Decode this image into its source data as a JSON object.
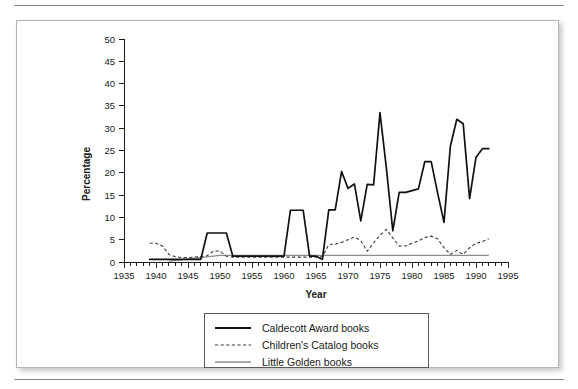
{
  "figure": {
    "has_top_rule": true,
    "has_bottom_rule": true,
    "border_color": "#b5b5b5",
    "background": "#ffffff"
  },
  "chart_data": {
    "type": "line",
    "title": "",
    "xlabel": "Year",
    "ylabel": "Percentage",
    "xlim": [
      1935,
      1995
    ],
    "ylim": [
      0,
      50
    ],
    "xticks": [
      1935,
      1940,
      1945,
      1950,
      1955,
      1960,
      1965,
      1970,
      1975,
      1980,
      1985,
      1990,
      1995
    ],
    "yticks": [
      0,
      5,
      10,
      15,
      20,
      25,
      30,
      35,
      40,
      45,
      50
    ],
    "x_minor_tick_step": 1,
    "grid": false,
    "legend_position": "below-center",
    "series": [
      {
        "name": "Caldecott Award books",
        "style": "solid",
        "color": "#111111",
        "width": 1.7,
        "x": [
          1939,
          1940,
          1941,
          1942,
          1943,
          1944,
          1945,
          1946,
          1947,
          1948,
          1949,
          1950,
          1951,
          1952,
          1953,
          1954,
          1955,
          1956,
          1957,
          1958,
          1959,
          1960,
          1961,
          1962,
          1963,
          1964,
          1965,
          1966,
          1967,
          1968,
          1969,
          1970,
          1971,
          1972,
          1973,
          1974,
          1975,
          1976,
          1977,
          1978,
          1979,
          1980,
          1981,
          1982,
          1983,
          1984,
          1985,
          1986,
          1987,
          1988,
          1989,
          1990,
          1991,
          1992
        ],
        "values": [
          0.6,
          0.6,
          0.6,
          0.6,
          0.6,
          0.6,
          0.6,
          0.6,
          0.6,
          6.5,
          6.5,
          6.5,
          6.5,
          1.3,
          1.3,
          1.3,
          1.3,
          1.3,
          1.3,
          1.3,
          1.3,
          1.3,
          11.6,
          11.6,
          11.6,
          1.3,
          1.3,
          0.6,
          11.7,
          11.7,
          20.3,
          16.5,
          17.5,
          9.2,
          17.4,
          17.3,
          33.5,
          21.0,
          7.0,
          15.6,
          15.6,
          16.0,
          16.4,
          22.5,
          22.5,
          15.5,
          8.9,
          26.0,
          32.0,
          31.0,
          14.2,
          23.5,
          25.4,
          25.4
        ]
      },
      {
        "name": "Children's Catalog books",
        "style": "dashed",
        "color": "#3a3a3a",
        "width": 1.1,
        "x": [
          1939,
          1940,
          1941,
          1942,
          1943,
          1944,
          1945,
          1946,
          1947,
          1948,
          1949,
          1950,
          1951,
          1952,
          1953,
          1954,
          1955,
          1956,
          1957,
          1958,
          1959,
          1960,
          1961,
          1962,
          1963,
          1964,
          1965,
          1966,
          1967,
          1968,
          1969,
          1970,
          1971,
          1972,
          1973,
          1974,
          1975,
          1976,
          1977,
          1978,
          1979,
          1980,
          1981,
          1982,
          1983,
          1984,
          1985,
          1986,
          1987,
          1988,
          1989,
          1990,
          1991,
          1992
        ],
        "values": [
          4.2,
          4.2,
          3.6,
          1.7,
          1.2,
          1.0,
          1.0,
          1.1,
          1.2,
          1.4,
          2.5,
          2.4,
          1.3,
          1.1,
          1.1,
          1.1,
          1.1,
          1.1,
          1.1,
          1.1,
          1.1,
          1.1,
          1.1,
          1.1,
          1.1,
          1.1,
          1.1,
          1.2,
          3.9,
          4.0,
          4.4,
          5.0,
          5.6,
          4.8,
          2.4,
          4.3,
          6.0,
          7.3,
          5.4,
          3.6,
          3.6,
          4.2,
          4.7,
          5.5,
          5.8,
          5.2,
          3.2,
          1.7,
          2.6,
          1.7,
          3.2,
          4.2,
          4.6,
          5.2
        ]
      },
      {
        "name": "Little Golden books",
        "style": "solid",
        "color": "#8d8d8d",
        "width": 1.3,
        "x": [
          1942,
          1950,
          1960,
          1970,
          1980,
          1992
        ],
        "values": [
          0.2,
          1.5,
          1.5,
          1.5,
          1.5,
          1.5
        ]
      }
    ]
  },
  "legend": {
    "items": [
      {
        "label": "Caldecott Award books",
        "style": "solid",
        "color": "#111111"
      },
      {
        "label": "Children's Catalog books",
        "style": "dashed",
        "color": "#3a3a3a"
      },
      {
        "label": "Little Golden books",
        "style": "solid",
        "color": "#8d8d8d"
      }
    ]
  }
}
